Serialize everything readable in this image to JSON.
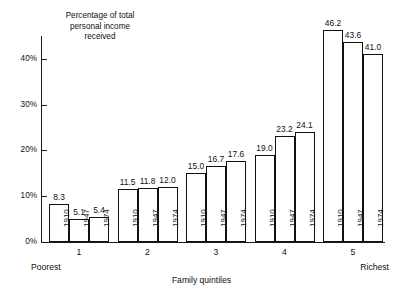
{
  "chart_data": {
    "type": "bar",
    "title": "",
    "ylabel": "Percentage of total\npersonal income\nreceived",
    "xlabel": "Family quintiles",
    "categories": [
      "1",
      "2",
      "3",
      "4",
      "5"
    ],
    "category_edge_labels": {
      "left": "Poorest",
      "right": "Richest"
    },
    "series": [
      {
        "name": "1910",
        "values": [
          8.3,
          11.5,
          15.0,
          19.0,
          46.2
        ]
      },
      {
        "name": "1947",
        "values": [
          5.1,
          11.8,
          16.7,
          23.2,
          43.6
        ]
      },
      {
        "name": "1974",
        "values": [
          5.4,
          12.0,
          17.6,
          24.1,
          41.0
        ]
      }
    ],
    "ylim": [
      0,
      46.2
    ],
    "yticks": [
      0,
      10,
      20,
      30,
      40
    ],
    "ytick_labels": [
      "0%",
      "10%",
      "20%",
      "30%",
      "40%"
    ],
    "grid": false,
    "legend": "none",
    "bar_style": {
      "fill": "#ffffff",
      "stroke": "#111111"
    }
  },
  "axis": {
    "y_title": "Percentage of total\npersonal income\nreceived",
    "x_title": "Family quintiles",
    "y_ticks": [
      {
        "label": "0%",
        "value": 0
      },
      {
        "label": "10%",
        "value": 10
      },
      {
        "label": "20%",
        "value": 20
      },
      {
        "label": "30%",
        "value": 30
      },
      {
        "label": "40%",
        "value": 40
      }
    ]
  },
  "groups": [
    {
      "label": "1",
      "bars": [
        {
          "year": "1910",
          "value": "8.3"
        },
        {
          "year": "1947",
          "value": "5.1"
        },
        {
          "year": "1974",
          "value": "5.4"
        }
      ]
    },
    {
      "label": "2",
      "bars": [
        {
          "year": "1910",
          "value": "11.5"
        },
        {
          "year": "1947",
          "value": "11.8"
        },
        {
          "year": "1974",
          "value": "12.0"
        }
      ]
    },
    {
      "label": "3",
      "bars": [
        {
          "year": "1910",
          "value": "15.0"
        },
        {
          "year": "1947",
          "value": "16.7"
        },
        {
          "year": "1974",
          "value": "17.6"
        }
      ]
    },
    {
      "label": "4",
      "bars": [
        {
          "year": "1910",
          "value": "19.0"
        },
        {
          "year": "1947",
          "value": "23.2"
        },
        {
          "year": "1974",
          "value": "24.1"
        }
      ]
    },
    {
      "label": "5",
      "bars": [
        {
          "year": "1910",
          "value": "46.2"
        },
        {
          "year": "1947",
          "value": "43.6"
        },
        {
          "year": "1974",
          "value": "41.0"
        }
      ]
    }
  ],
  "edge_labels": {
    "left": "Poorest",
    "right": "Richest"
  },
  "colors": {
    "ink": "#111111",
    "paper": "#ffffff"
  }
}
